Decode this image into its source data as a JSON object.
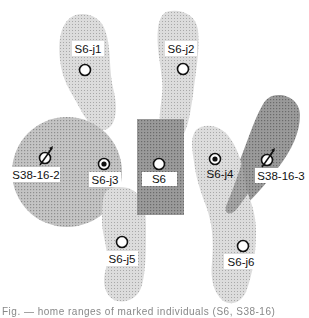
{
  "diagram": {
    "colors": {
      "light_region": "#d0d0d0",
      "medium_region": "#b4b4b4",
      "dark_region": "#8e8e8e",
      "circle_region": "#b8b8b8",
      "label_bg": "#ffffff",
      "marker": "#111111"
    },
    "nodes": [
      {
        "id": "S6-j1",
        "label": "S6-j1",
        "symbol": "open-circle",
        "region": "light"
      },
      {
        "id": "S6-j2",
        "label": "S6-j2",
        "symbol": "open-circle",
        "region": "light"
      },
      {
        "id": "S38-16-2",
        "label": "S38-16-2",
        "symbol": "male-slashed-circle",
        "region": "circle"
      },
      {
        "id": "S6-j3",
        "label": "S6-j3",
        "symbol": "dotted-circle",
        "region": "circle"
      },
      {
        "id": "S6",
        "label": "S6",
        "symbol": "open-circle",
        "region": "dark-rect"
      },
      {
        "id": "S6-j4",
        "label": "S6-j4",
        "symbol": "dotted-circle",
        "region": "light"
      },
      {
        "id": "S38-16-3",
        "label": "S38-16-3",
        "symbol": "male-slashed-circle",
        "region": "dark"
      },
      {
        "id": "S6-j5",
        "label": "S6-j5",
        "symbol": "open-circle",
        "region": "light"
      },
      {
        "id": "S6-j6",
        "label": "S6-j6",
        "symbol": "open-circle",
        "region": "light"
      }
    ],
    "caption_truncated": "Fig. — home ranges of marked individuals (S6, S38-16)"
  }
}
